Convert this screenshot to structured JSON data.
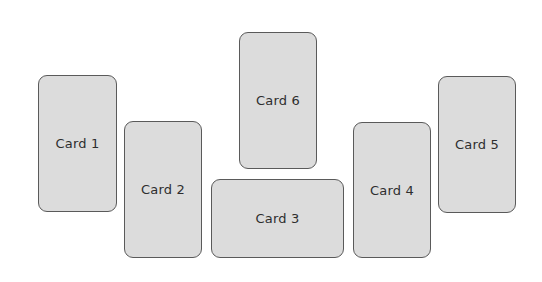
{
  "cards": [
    {
      "id": "card-1",
      "label": "Card 1"
    },
    {
      "id": "card-2",
      "label": "Card 2"
    },
    {
      "id": "card-3",
      "label": "Card 3"
    },
    {
      "id": "card-4",
      "label": "Card 4"
    },
    {
      "id": "card-5",
      "label": "Card 5"
    },
    {
      "id": "card-6",
      "label": "Card 6"
    }
  ],
  "colors": {
    "card_fill": "#dcdcdc",
    "card_border": "#5a5a5a",
    "label_text": "#2e2e2e",
    "background": "#ffffff"
  }
}
